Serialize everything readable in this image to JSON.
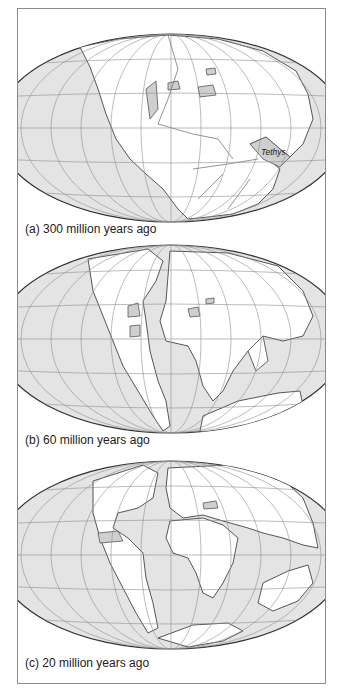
{
  "figure": {
    "colors": {
      "ocean": "#e4e4e4",
      "land": "#ffffff",
      "inland_sea": "#cfcfcf",
      "coastline": "#555555",
      "grid": "#8f8f8f",
      "frame": "#8a8a8a"
    },
    "panels": [
      {
        "id": "a",
        "caption": "(a) 300 million years ago",
        "labels": [
          {
            "text": "Tethys"
          }
        ]
      },
      {
        "id": "b",
        "caption": "(b) 60 million years ago",
        "labels": []
      },
      {
        "id": "c",
        "caption": "(c) 20 million years ago",
        "labels": []
      }
    ]
  }
}
